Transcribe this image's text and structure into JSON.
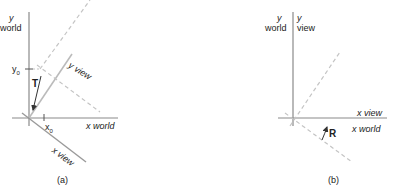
{
  "figure_a": {
    "y_axis_label_var": "y",
    "y_axis_label_name": "world",
    "x_axis_label": "x world",
    "y_view_label": "y view",
    "x_view_label": "x view",
    "y0_label": "y",
    "y0_sub": "0",
    "x0_label": "x",
    "x0_sub": "0",
    "translation_label": "T",
    "caption": "(a)"
  },
  "figure_b": {
    "y_world_var": "y",
    "y_world_name": "world",
    "y_view_var": "y",
    "y_view_name": "view",
    "x_view_label": "x view",
    "x_world_label": "x world",
    "rotation_label": "R",
    "caption": "(b)"
  },
  "colors": {
    "axis": "#8a8a8a",
    "view_axis": "#b5b5b5",
    "dashed": "#bdbdbd",
    "arrow": "#333333",
    "text": "#222222"
  }
}
